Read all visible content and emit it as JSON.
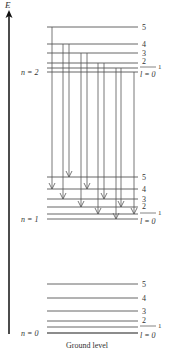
{
  "top_fragment": "y  …  E  …  ΔV",
  "axis": {
    "label": "E"
  },
  "groups": [
    {
      "name": "n = 2",
      "levels": [
        {
          "l": "5",
          "y": 27
        },
        {
          "l": "4",
          "y": 44
        },
        {
          "l": "3",
          "y": 53
        },
        {
          "l": "2",
          "y": 63
        },
        {
          "l": "1",
          "y": 68
        },
        {
          "l": "l = 0",
          "y": 72
        }
      ]
    },
    {
      "name": "n = 1",
      "levels": [
        {
          "l": "5",
          "y": 177
        },
        {
          "l": "4",
          "y": 189
        },
        {
          "l": "3",
          "y": 199
        },
        {
          "l": "2",
          "y": 207
        },
        {
          "l": "1",
          "y": 214
        },
        {
          "l": "l = 0",
          "y": 219
        }
      ]
    },
    {
      "name": "n = 0",
      "levels": [
        {
          "l": "5",
          "y": 284
        },
        {
          "l": "4",
          "y": 298
        },
        {
          "l": "3",
          "y": 311
        },
        {
          "l": "2",
          "y": 321
        },
        {
          "l": "1",
          "y": 327
        },
        {
          "l": "l = 0",
          "y": 333
        }
      ]
    }
  ],
  "transitions": [
    {
      "x": 52,
      "from_l": 5,
      "to_l": 4
    },
    {
      "x": 63,
      "from_l": 4,
      "to_l": 3
    },
    {
      "x": 69,
      "from_l": 4,
      "to_l": 5
    },
    {
      "x": 81,
      "from_l": 3,
      "to_l": 2
    },
    {
      "x": 87,
      "from_l": 3,
      "to_l": 4
    },
    {
      "x": 98,
      "from_l": 2,
      "to_l": 1
    },
    {
      "x": 104,
      "from_l": 2,
      "to_l": 3
    },
    {
      "x": 116,
      "from_l": 1,
      "to_l": 0
    },
    {
      "x": 121,
      "from_l": 1,
      "to_l": 2
    },
    {
      "x": 134,
      "from_l": 0,
      "to_l": 1
    }
  ],
  "labels": {
    "n2": "n = 2",
    "n1": "n = 1",
    "n0": "n = 0",
    "ground": "Ground level",
    "l5": "5",
    "l4": "4",
    "l3": "3",
    "l2": "2",
    "l1": "1",
    "l0": "l = 0"
  }
}
